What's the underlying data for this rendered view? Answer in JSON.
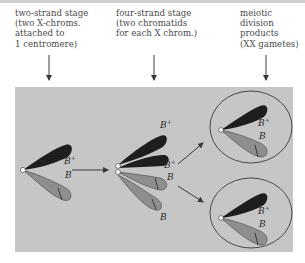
{
  "stages": [
    {
      "id": "two-strand",
      "lines": [
        "two-strand stage",
        "(two X-chroms.",
        "attached to",
        "1 centromere)"
      ]
    },
    {
      "id": "four-strand",
      "lines": [
        "four-strand stage",
        "(two chromatids",
        "for each X chrom.)"
      ]
    },
    {
      "id": "meiotic",
      "lines": [
        "meiotic",
        "division",
        "products",
        "(XX gametes)"
      ]
    }
  ],
  "allele_labels": {
    "b_plus": "B",
    "b_plus_sup": "+",
    "b": "B"
  },
  "colors": {
    "panel": "#c6c6c6",
    "dark_chromosome": "#1e1e1e",
    "light_chromosome": "#8e8e8e",
    "arrow": "#3a3a3a",
    "text": "#4a4a4a"
  }
}
